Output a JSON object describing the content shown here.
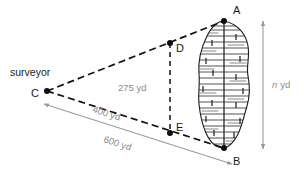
{
  "figure": {
    "type": "geometry-diagram",
    "background_color": "#ffffff",
    "stroke_color": "#1a1a1a",
    "dimension_color": "#8c8c8c"
  },
  "labels": {
    "surveyor": "surveyor",
    "point_a": "A",
    "point_b": "B",
    "point_c": "C",
    "point_d": "D",
    "point_e": "E"
  },
  "dimensions": {
    "de": "275 yd",
    "ce": "400 yd",
    "cb": "600 yd",
    "ab_italic": "n",
    "ab_unit": "yd"
  },
  "geometry": {
    "points": {
      "A": {
        "x": 224,
        "y": 21
      },
      "B": {
        "x": 224,
        "y": 148
      },
      "C": {
        "x": 47,
        "y": 91
      },
      "D": {
        "x": 170,
        "y": 43
      },
      "E": {
        "x": 170,
        "y": 133
      }
    },
    "segments": [
      {
        "name": "CA",
        "from": "C",
        "to": "A",
        "style": "dashed"
      },
      {
        "name": "CB",
        "from": "C",
        "to": "B",
        "style": "dashed"
      },
      {
        "name": "DE",
        "from": "D",
        "to": "E",
        "style": "dashed"
      }
    ],
    "dimension_arrows": [
      {
        "name": "n-yd-vertical",
        "x": 263,
        "y1": 20,
        "y2": 150,
        "double_headed": true
      },
      {
        "name": "600-yd-diagonal",
        "x1": 44,
        "y1": 104,
        "x2": 232,
        "y2": 163,
        "double_headed": true
      }
    ]
  },
  "lake": {
    "name": "lake",
    "fill": "#ffffff",
    "hatch": "horizontal-water-lines"
  }
}
